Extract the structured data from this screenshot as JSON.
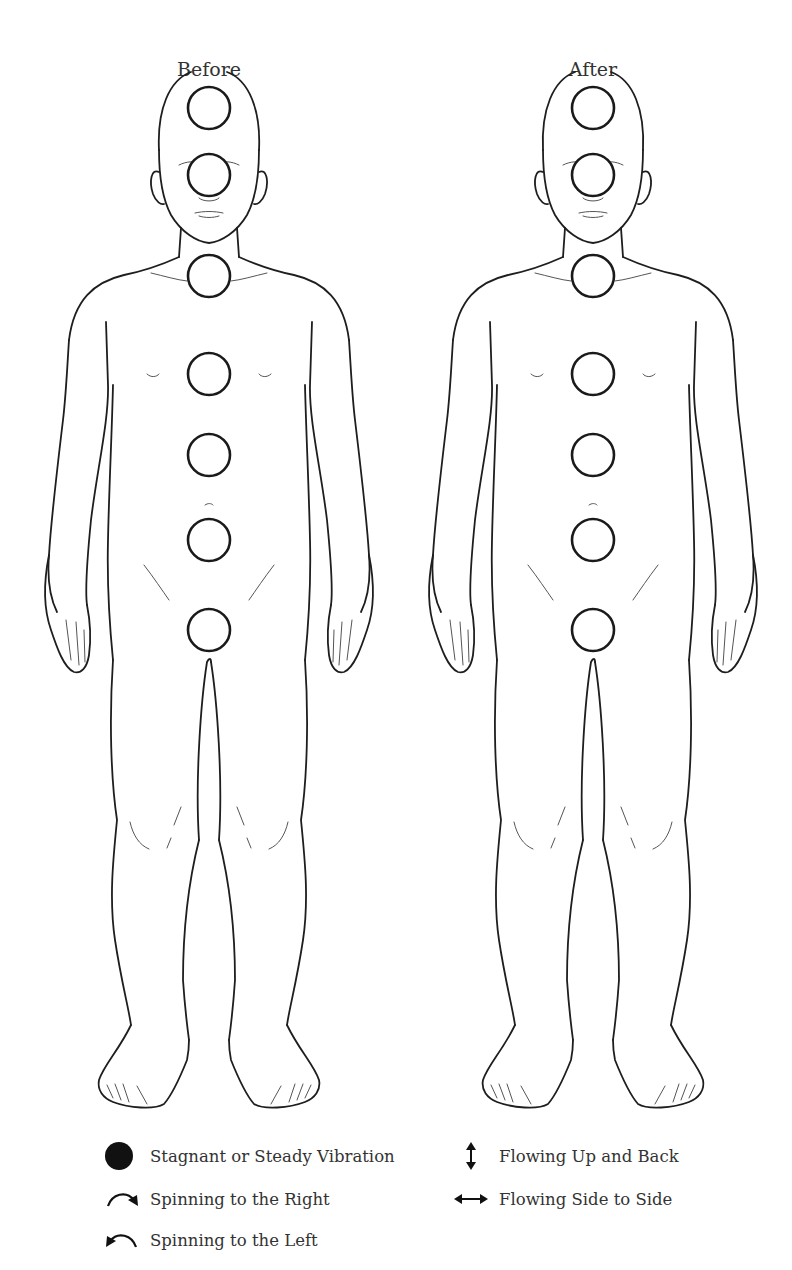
{
  "figures": [
    {
      "id": "before",
      "label": "Before",
      "center_x": 209,
      "chakras": [
        {
          "name": "crown",
          "cy": 108
        },
        {
          "name": "third-eye",
          "cy": 175
        },
        {
          "name": "throat",
          "cy": 276
        },
        {
          "name": "heart",
          "cy": 374
        },
        {
          "name": "solar-plexus",
          "cy": 455
        },
        {
          "name": "sacral",
          "cy": 540
        },
        {
          "name": "root",
          "cy": 630
        }
      ]
    },
    {
      "id": "after",
      "label": "After",
      "center_x": 593,
      "chakras": [
        {
          "name": "crown",
          "cy": 108
        },
        {
          "name": "third-eye",
          "cy": 175
        },
        {
          "name": "throat",
          "cy": 276
        },
        {
          "name": "heart",
          "cy": 374
        },
        {
          "name": "solar-plexus",
          "cy": 455
        },
        {
          "name": "sacral",
          "cy": 540
        },
        {
          "name": "root",
          "cy": 630
        }
      ]
    }
  ],
  "chakra_radius": 21,
  "legend": {
    "left": [
      {
        "icon": "filled-circle-icon",
        "label": "Stagnant or Steady Vibration"
      },
      {
        "icon": "clockwise-arrow-icon",
        "label": "Spinning to the Right"
      },
      {
        "icon": "counterclockwise-arrow-icon",
        "label": "Spinning to the Left"
      }
    ],
    "right": [
      {
        "icon": "vertical-double-arrow-icon",
        "label": "Flowing Up and Back"
      },
      {
        "icon": "horizontal-double-arrow-icon",
        "label": "Flowing Side to Side"
      }
    ]
  },
  "colors": {
    "line": "#1e1e1e",
    "text": "#333333",
    "background": "#ffffff"
  }
}
